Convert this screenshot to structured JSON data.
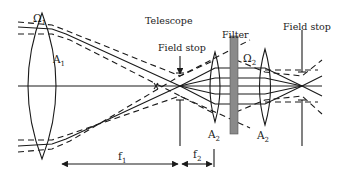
{
  "diagram": {
    "labels": {
      "omega1": "Ω",
      "omega1_sub": "1",
      "lens1": "A",
      "lens1_sub": "1",
      "telescope": "Telescope",
      "field_stop_1": "Field stop",
      "filter": "Filter",
      "omega2": "Ω",
      "omega2_sub": "2",
      "field_stop_2": "Field stop",
      "lens2a": "A",
      "lens2a_sub": "2",
      "lens2b": "A",
      "lens2b_sub": "2",
      "f1": "f",
      "f1_sub": "1",
      "f2": "f",
      "f2_sub": "2"
    },
    "colors": {
      "ink": "#1a1a1a",
      "filter_fill": "#8a8a8a",
      "background": "#ffffff"
    }
  }
}
